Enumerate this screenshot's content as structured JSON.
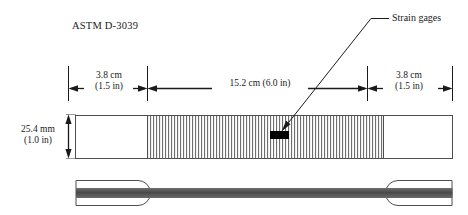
{
  "diagram": {
    "title": "ASTM D-3039",
    "annotation": {
      "label": "Strain gages"
    },
    "dimensions": {
      "left_tab": {
        "metric": "3.8 cm",
        "imperial": "(1.5 in)"
      },
      "gage_length": {
        "combined": "15.2 cm (6.0 in)"
      },
      "right_tab": {
        "metric": "3.8 cm",
        "imperial": "(1.5 in)"
      },
      "width": {
        "metric": "25.4 mm",
        "imperial": "(1.0 in)"
      }
    },
    "colors": {
      "line": "#1a1a1a",
      "outline": "#555555",
      "hatch": "#707070",
      "gage_fill": "#000000",
      "laminate": "#585858",
      "background": "#ffffff"
    },
    "views": {
      "plan": "plan-view",
      "side": "side-view"
    }
  }
}
